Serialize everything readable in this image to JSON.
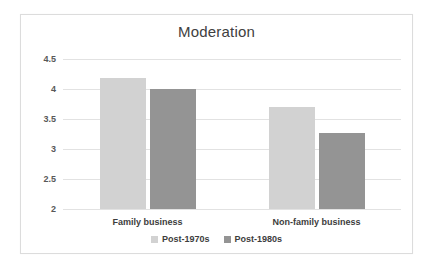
{
  "chart_data": {
    "type": "bar",
    "title": "Moderation",
    "xlabel": "",
    "ylabel": "",
    "categories": [
      "Family business",
      "Non-family business"
    ],
    "series": [
      {
        "name": "Post-1970s",
        "values": [
          4.18,
          3.7
        ],
        "color": "#d2d2d2"
      },
      {
        "name": "Post-1980s",
        "values": [
          4.0,
          3.27
        ],
        "color": "#949494"
      }
    ],
    "ylim": [
      2,
      4.5
    ],
    "yticks": [
      4.5,
      4,
      3.5,
      3,
      2.5,
      2
    ],
    "ytick_labels": [
      "4.5",
      "4",
      "3.5",
      "3",
      "2.5",
      "2"
    ],
    "grid": true,
    "legend_position": "bottom",
    "gridline_color": "#e2e2e2",
    "border_color": "#dcdcdc",
    "background": "#ffffff"
  },
  "legend": {
    "items": [
      {
        "label": "Post-1970s",
        "swatch": "legend-swatch-series-a"
      },
      {
        "label": "Post-1980s",
        "swatch": "legend-swatch-series-b"
      }
    ]
  }
}
